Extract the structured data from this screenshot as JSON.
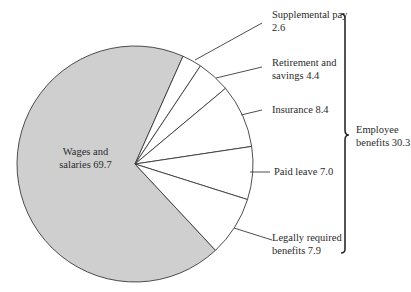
{
  "chart_data": {
    "type": "pie",
    "title": "",
    "categories": [
      "Wages and salaries",
      "Supplemental pay",
      "Retirement and savings",
      "Insurance",
      "Paid leave",
      "Legally required benefits"
    ],
    "values": [
      69.7,
      2.6,
      4.4,
      8.4,
      7.0,
      7.9
    ],
    "slice_colors": [
      "#cfcfcf",
      "#ffffff",
      "#ffffff",
      "#ffffff",
      "#ffffff",
      "#ffffff"
    ],
    "group": {
      "label": "Employee benefits",
      "value": 30.3,
      "members": [
        "Supplemental pay",
        "Retirement and savings",
        "Insurance",
        "Paid leave",
        "Legally required benefits"
      ]
    },
    "legend": "none",
    "grid": false
  },
  "labels": {
    "wages": [
      "Wages and",
      "salaries 69.7"
    ],
    "supplemental": [
      "Supplemental pay",
      "2.6"
    ],
    "retirement": [
      "Retirement and",
      "savings 4.4"
    ],
    "insurance": [
      "Insurance 8.4"
    ],
    "paid_leave": [
      "Paid leave 7.0"
    ],
    "legally": [
      "Legally required",
      "benefits 7.9"
    ],
    "benefits": [
      "Employee",
      "benefits 30.3"
    ]
  },
  "colors": {
    "wages_fill": "#cfcfcf",
    "benefit_fill": "#ffffff",
    "stroke": "#3a3a3a"
  }
}
